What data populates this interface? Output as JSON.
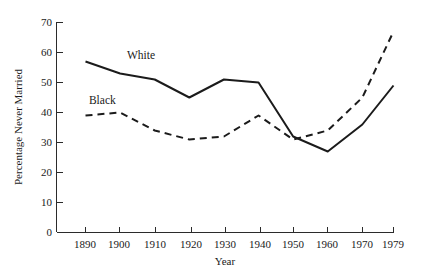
{
  "chart_data": {
    "type": "line",
    "title": "",
    "xlabel": "Year",
    "ylabel": "Percentage Never Married",
    "x": [
      1890,
      1900,
      1910,
      1920,
      1930,
      1940,
      1950,
      1960,
      1970,
      1979
    ],
    "xlim": [
      1890,
      1979
    ],
    "ylim": [
      0,
      70
    ],
    "xticks": [
      "1890",
      "1900",
      "1910",
      "1920",
      "1930",
      "1940",
      "1950",
      "1960",
      "1970",
      "1979"
    ],
    "yticks": [
      "0",
      "10",
      "20",
      "30",
      "40",
      "50",
      "60",
      "70"
    ],
    "grid": false,
    "legend_position": "inline-labels",
    "series": [
      {
        "name": "White",
        "style": "solid",
        "color": "#1b1b1b",
        "values": [
          57,
          53,
          51,
          45,
          51,
          50,
          32,
          27,
          36,
          49
        ]
      },
      {
        "name": "Black",
        "style": "dashed",
        "color": "#1b1b1b",
        "values": [
          39,
          40,
          34,
          31,
          32,
          39,
          31,
          34,
          45,
          67
        ]
      }
    ],
    "annotations": [
      {
        "text": "White",
        "x": 1902,
        "y": 58
      },
      {
        "text": "Black",
        "x": 1891,
        "y": 43
      }
    ]
  },
  "axes": {
    "y_axis_name": "percentage-never-married-axis",
    "x_axis_name": "year-axis"
  }
}
